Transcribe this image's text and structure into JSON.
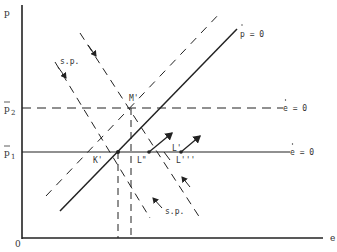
{
  "diagram": {
    "axes": {
      "y_label": "p",
      "x_label": "e",
      "origin_label": "0"
    },
    "levels": {
      "p2_label": "p",
      "p2_sub": "2",
      "p1_label": "p",
      "p1_sub": "1"
    },
    "curves": {
      "p_dot_zero": "p = 0",
      "e_dot_zero_upper": "e = 0",
      "e_dot_zero_lower": "e = 0",
      "sp_upper": "s.p.",
      "sp_lower": "s.p."
    },
    "points": {
      "M": "M'",
      "K": "K'",
      "L1": "L'",
      "L2": "L\"",
      "L3": "L'''"
    },
    "colors": {
      "ink": "#222222",
      "background": "#ffffff"
    }
  }
}
